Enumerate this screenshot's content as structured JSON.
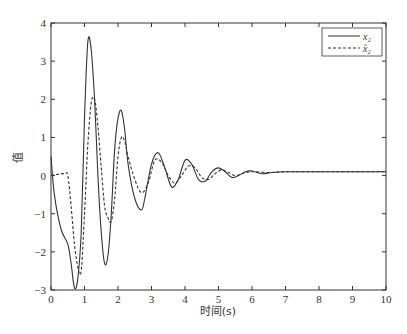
{
  "chart_data": {
    "type": "line",
    "title": "",
    "xlabel": "时间(s)",
    "ylabel": "值",
    "xlim": [
      0,
      10
    ],
    "ylim": [
      -3,
      4
    ],
    "xticks": [
      "0",
      "1",
      "2",
      "3",
      "4",
      "5",
      "6",
      "7",
      "8",
      "9",
      "10"
    ],
    "yticks": [
      "-3",
      "-2",
      "-1",
      "0",
      "1",
      "2",
      "3",
      "4"
    ],
    "grid": false,
    "legend_position": "upper right",
    "note": "Series values are approximate, estimated visually from curve peaks/troughs.",
    "series": [
      {
        "name": "x2",
        "label": "x₂",
        "style": "solid",
        "x": [
          0,
          0.1,
          0.3,
          0.5,
          0.6,
          0.7,
          0.8,
          0.9,
          1.0,
          1.1,
          1.2,
          1.3,
          1.4,
          1.5,
          1.6,
          1.7,
          1.8,
          1.9,
          2.0,
          2.1,
          2.2,
          2.3,
          2.5,
          2.7,
          2.8,
          3.0,
          3.2,
          3.4,
          3.6,
          3.8,
          4.0,
          4.2,
          4.4,
          4.6,
          4.8,
          5.0,
          5.2,
          5.4,
          5.6,
          5.8,
          6.0,
          6.3,
          6.6,
          7.0,
          7.5,
          8.0,
          9.0,
          10.0
        ],
        "y": [
          0.5,
          -0.5,
          -1.4,
          -1.8,
          -2.3,
          -2.95,
          -2.7,
          -1.5,
          1.5,
          3.5,
          3.3,
          2.0,
          0.0,
          -1.5,
          -2.3,
          -2.1,
          -1.0,
          0.7,
          1.5,
          1.7,
          1.2,
          0.3,
          -0.6,
          -0.9,
          -0.6,
          0.3,
          0.6,
          0.2,
          -0.3,
          -0.1,
          0.4,
          0.3,
          -0.1,
          -0.15,
          0.1,
          0.2,
          0.1,
          -0.05,
          0.0,
          0.1,
          0.12,
          0.05,
          0.08,
          0.1,
          0.1,
          0.1,
          0.1,
          0.1
        ]
      },
      {
        "name": "x2_hat",
        "label": "x̂₂",
        "style": "dashed",
        "x": [
          0,
          0.1,
          0.4,
          0.5,
          0.6,
          0.7,
          0.8,
          0.9,
          1.0,
          1.1,
          1.2,
          1.3,
          1.4,
          1.5,
          1.6,
          1.7,
          1.8,
          1.9,
          2.0,
          2.1,
          2.2,
          2.3,
          2.5,
          2.7,
          2.9,
          3.1,
          3.3,
          3.5,
          3.7,
          3.9,
          4.1,
          4.3,
          4.5,
          4.7,
          4.9,
          5.1,
          5.3,
          5.5,
          5.7,
          6.0,
          6.5,
          7.0,
          8.0,
          9.0,
          10.0
        ],
        "y": [
          0.0,
          0.02,
          0.05,
          0.0,
          -0.8,
          -1.8,
          -2.4,
          -2.5,
          -1.0,
          0.8,
          1.9,
          2.0,
          1.3,
          0.2,
          -0.8,
          -1.1,
          -1.2,
          -0.6,
          0.5,
          1.0,
          0.9,
          0.5,
          -0.1,
          -0.45,
          -0.2,
          0.4,
          0.35,
          0.0,
          -0.2,
          0.0,
          0.25,
          0.2,
          -0.05,
          -0.1,
          0.05,
          0.15,
          0.08,
          0.0,
          0.05,
          0.1,
          0.08,
          0.1,
          0.1,
          0.1,
          0.1
        ]
      }
    ]
  },
  "legend": {
    "items": [
      {
        "label": "x₂",
        "style": "solid"
      },
      {
        "label": "x̂₂",
        "style": "dashed"
      }
    ]
  },
  "colors": {
    "line": "#333333",
    "axis": "#333333",
    "background": "#ffffff"
  }
}
